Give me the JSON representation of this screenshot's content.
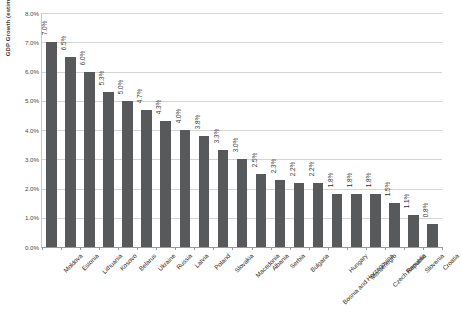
{
  "chart_data": {
    "type": "bar",
    "title": "",
    "xlabel": "",
    "ylabel": "GDP Growth (estimated, 2011)",
    "ylim": [
      0,
      8
    ],
    "ytick_labels": [
      "8.0%",
      "7.0%",
      "6.0%",
      "5.0%",
      "4.0%",
      "3.0%",
      "2.0%",
      "1.0%",
      "0.0%"
    ],
    "ytick_values": [
      8,
      7,
      6,
      5,
      4,
      3,
      2,
      1,
      0
    ],
    "grid": true,
    "legend": "none",
    "bar_color": "#58595b",
    "categories": [
      "Moldova",
      "Estonia",
      "Lithuania",
      "Kosovo",
      "Belarus",
      "Ukraine",
      "Russia",
      "Latvia",
      "Poland",
      "Slovakia",
      "Macedonia",
      "Albania",
      "Serbia",
      "Bulgaria",
      "Bosnia and Herzegovina",
      "Hungary",
      "Montenegro",
      "Czech Republic",
      "Romania",
      "Slovenia",
      "Croatia"
    ],
    "values": [
      7.0,
      6.5,
      6.0,
      5.3,
      5.0,
      4.7,
      4.3,
      4.0,
      3.8,
      3.3,
      3.0,
      2.5,
      2.3,
      2.2,
      2.2,
      1.8,
      1.8,
      1.8,
      1.5,
      1.1,
      0.8
    ],
    "data_labels": [
      "7.0%",
      "6.5%",
      "6.0%",
      "5.3%",
      "5.0%",
      "4.7%",
      "4.3%",
      "4.0%",
      "3.8%",
      "3.3%",
      "3.0%",
      "2.5%",
      "2.3%",
      "2.2%",
      "2.2%",
      "1.8%",
      "1.8%",
      "1.8%",
      "1.5%",
      "1.1%",
      "0.8%"
    ]
  }
}
